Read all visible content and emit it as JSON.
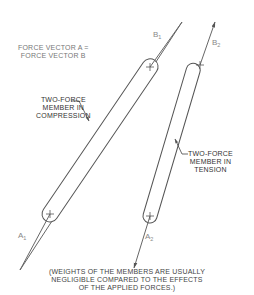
{
  "header_note": {
    "line1": "FORCE VECTOR A =",
    "line2": "FORCE VECTOR B"
  },
  "members": [
    {
      "id": "compression",
      "label_lines": [
        "TWO-FORCE",
        "MEMBER IN",
        "COMPRESSION"
      ],
      "end_a": {
        "letter": "A",
        "sub": "1"
      },
      "end_b": {
        "letter": "B",
        "sub": "1"
      }
    },
    {
      "id": "tension",
      "label_lines": [
        "TWO-FORCE",
        "MEMBER IN",
        "TENSION"
      ],
      "end_a": {
        "letter": "A",
        "sub": "2"
      },
      "end_b": {
        "letter": "B",
        "sub": "2"
      }
    }
  ],
  "footnote": {
    "line1": "(WEIGHTS OF THE MEMBERS ARE USUALLY",
    "line2": "NEGLIGIBLE COMPARED TO THE EFFECTS",
    "line3": "OF THE APPLIED FORCES.)"
  },
  "colors": {
    "stroke": "#555555",
    "text": "#777777"
  }
}
